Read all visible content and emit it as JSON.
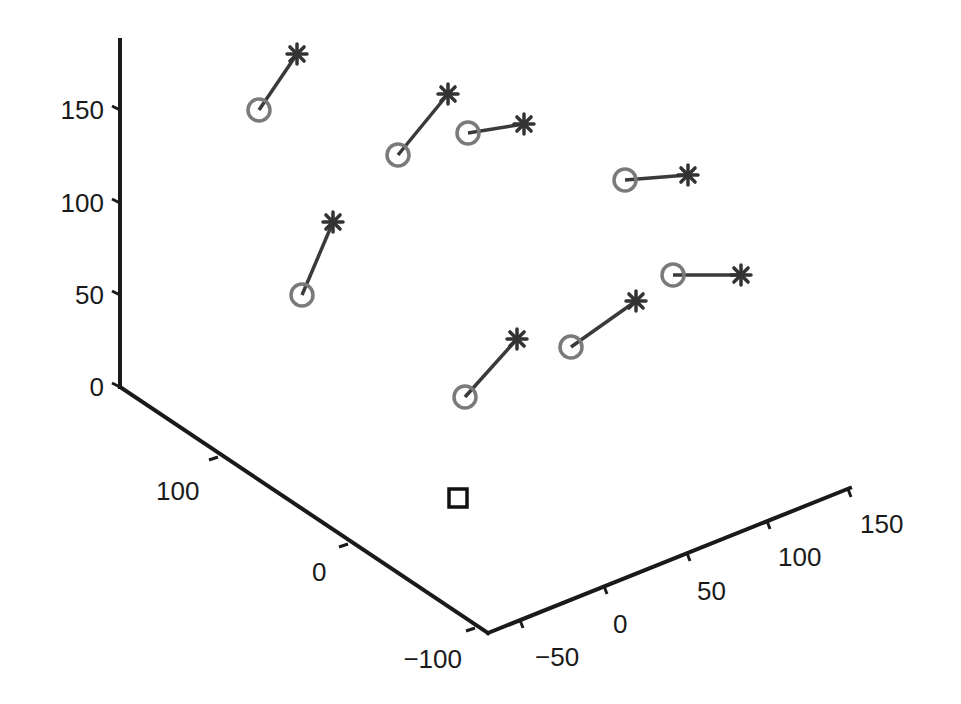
{
  "chart_data": {
    "type": "scatter",
    "subtype": "3d-scatter-with-displacement-lines",
    "title": "",
    "xlabel": "",
    "ylabel": "",
    "zlabel": "",
    "grid": false,
    "legend": null,
    "axes": {
      "z": {
        "ticks": [
          0,
          50,
          100,
          150
        ],
        "tick_labels": [
          "0",
          "50",
          "100",
          "150"
        ],
        "range": [
          0,
          180
        ]
      },
      "left_horizontal": {
        "ticks": [
          100,
          0,
          -100
        ],
        "tick_labels": [
          "100",
          "0",
          "−100"
        ],
        "range": [
          -100,
          170
        ]
      },
      "right_horizontal": {
        "ticks": [
          -50,
          0,
          50,
          100,
          150
        ],
        "tick_labels": [
          "−50",
          "0",
          "50",
          "100",
          "150"
        ],
        "range": [
          -70,
          150
        ]
      }
    },
    "series": [
      {
        "name": "initial positions",
        "marker": "circle",
        "color": "#7a7a7a"
      },
      {
        "name": "final positions",
        "marker": "asterisk",
        "color": "#333333"
      },
      {
        "name": "reference",
        "marker": "square",
        "color": "#111111"
      }
    ],
    "pairs_screen": [
      {
        "circle": [
          259,
          110
        ],
        "star": [
          297,
          54
        ]
      },
      {
        "circle": [
          398,
          155
        ],
        "star": [
          448,
          94
        ]
      },
      {
        "circle": [
          468,
          133
        ],
        "star": [
          524,
          124
        ]
      },
      {
        "circle": [
          625,
          180
        ],
        "star": [
          688,
          175
        ]
      },
      {
        "circle": [
          302,
          295
        ],
        "star": [
          333,
          222
        ]
      },
      {
        "circle": [
          673,
          275
        ],
        "star": [
          741,
          275
        ]
      },
      {
        "circle": [
          571,
          347
        ],
        "star": [
          636,
          301
        ]
      },
      {
        "circle": [
          465,
          397
        ],
        "star": [
          517,
          339
        ]
      }
    ],
    "square_screen": [
      458,
      498
    ],
    "approx_heights": {
      "circles": [
        150,
        125,
        137,
        112,
        50,
        60,
        22,
        -5
      ],
      "stars": [
        180,
        158,
        142,
        115,
        90,
        60,
        47,
        27
      ]
    }
  },
  "labels": {
    "z": [
      "0",
      "50",
      "100",
      "150"
    ],
    "left": [
      "100",
      "0",
      "−100"
    ],
    "right": [
      "−50",
      "0",
      "50",
      "100",
      "150"
    ]
  },
  "colors": {
    "axis": "#1a1a1a",
    "circle": "#7a7a7a",
    "star": "#333333",
    "line": "#3a3a3a",
    "square": "#111111"
  }
}
